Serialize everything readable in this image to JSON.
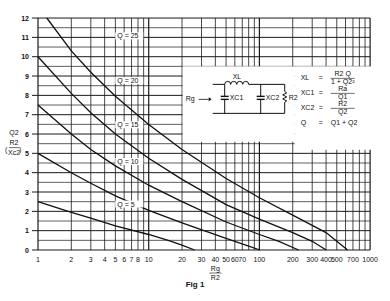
{
  "chart_data": {
    "type": "line",
    "title": "",
    "caption": "Fig 1",
    "xlabel": "Rg / R2",
    "xlabel_num": "Rg",
    "xlabel_den": "R2",
    "ylabel": "Q2 (R2 / Xc2)",
    "ylabel_top": "Q2",
    "ylabel_num": "R2",
    "ylabel_den": "Xc2",
    "x_scale": "log",
    "xlim": [
      1,
      1000
    ],
    "ylim": [
      0,
      12
    ],
    "grid": true,
    "x_ticks": [
      1,
      2,
      3,
      4,
      5,
      6,
      7,
      8,
      10,
      20,
      30,
      40,
      50,
      60,
      70,
      100,
      200,
      300,
      400,
      500,
      700,
      1000
    ],
    "x_tick_labels": [
      "1",
      "2",
      "3",
      "4",
      "5",
      "6",
      "7",
      "8",
      "10",
      "20",
      "30",
      "40",
      "50",
      "60",
      "70",
      "100",
      "200",
      "300",
      "400",
      "500",
      "700",
      "1000"
    ],
    "y_ticks": [
      0,
      1,
      2,
      3,
      4,
      5,
      6,
      7,
      8,
      9,
      10,
      11,
      12
    ],
    "series": [
      {
        "name": "Q = 25",
        "label_x": 5.2,
        "label_y": 11.0,
        "x": [
          1.2,
          2,
          3,
          5,
          10,
          20,
          50,
          100,
          200,
          400,
          626
        ],
        "values": [
          12.0,
          10.3,
          9.2,
          7.95,
          6.5,
          5.2,
          3.7,
          2.7,
          1.8,
          0.9,
          0.0
        ]
      },
      {
        "name": "Q = 20",
        "label_x": 5.2,
        "label_y": 8.7,
        "x": [
          1,
          2,
          3,
          5,
          10,
          20,
          50,
          100,
          200,
          300,
          401
        ],
        "values": [
          10.0,
          8.1,
          7.1,
          6.0,
          4.75,
          3.65,
          2.35,
          1.6,
          0.9,
          0.45,
          0.0
        ]
      },
      {
        "name": "Q = 15",
        "label_x": 5.2,
        "label_y": 6.4,
        "x": [
          1,
          2,
          3,
          5,
          10,
          20,
          50,
          100,
          150,
          226
        ],
        "values": [
          7.5,
          6.0,
          5.2,
          4.35,
          3.35,
          2.5,
          1.45,
          0.8,
          0.45,
          0.0
        ]
      },
      {
        "name": "Q = 10",
        "label_x": 5.2,
        "label_y": 4.5,
        "x": [
          1,
          2,
          3,
          5,
          10,
          20,
          50,
          80,
          101
        ],
        "values": [
          5.0,
          4.0,
          3.45,
          2.8,
          2.05,
          1.4,
          0.6,
          0.2,
          0.0
        ]
      },
      {
        "name": "Q = 5",
        "label_x": 5.2,
        "label_y": 2.3,
        "x": [
          1,
          2,
          3,
          5,
          10,
          15,
          20,
          26
        ],
        "values": [
          2.5,
          1.95,
          1.65,
          1.25,
          0.8,
          0.5,
          0.25,
          0.0
        ]
      }
    ],
    "legend": "none (inline curve labels)",
    "inset": {
      "circuit_labels": {
        "source": "Rg",
        "inductor": "XL",
        "cap1": "XC1",
        "cap2": "XC2",
        "load": "R2"
      },
      "equations": [
        {
          "lhs": "XL",
          "num": "R2 Q",
          "den": "1 + Q2²"
        },
        {
          "lhs": "XC1",
          "num": "Ra",
          "den": "Q1"
        },
        {
          "lhs": "XC2",
          "num": "R2",
          "den": "Q2"
        },
        {
          "lhs": "Q",
          "rhs": "Q1 + Q2"
        }
      ]
    }
  },
  "colors": {
    "line": "#111111",
    "grid": "#1a1a1a",
    "background": "#ffffff"
  }
}
